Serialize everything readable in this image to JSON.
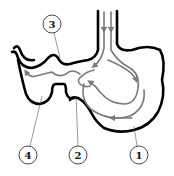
{
  "diagram": {
    "colors": {
      "outline": "#000000",
      "flow_arrows": "#7a7a7a",
      "background": "#ffffff"
    },
    "labels": [
      {
        "id": "1",
        "text": "1",
        "x": 139,
        "y": 155
      },
      {
        "id": "2",
        "text": "2",
        "x": 78,
        "y": 155
      },
      {
        "id": "3",
        "text": "3",
        "x": 52,
        "y": 24
      },
      {
        "id": "4",
        "text": "4",
        "x": 28,
        "y": 155
      }
    ]
  }
}
